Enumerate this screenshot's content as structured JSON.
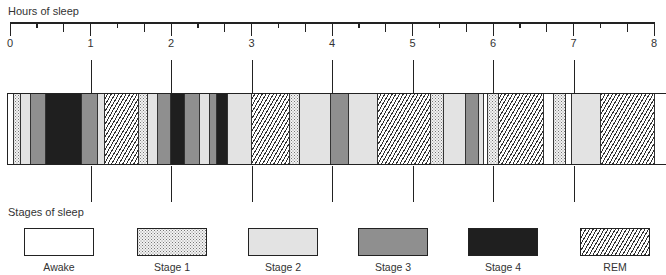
{
  "axis": {
    "title": "Hours of sleep",
    "min": 0,
    "max": 8,
    "tick_labels": [
      "0",
      "1",
      "2",
      "3",
      "4",
      "5",
      "6",
      "7",
      "8"
    ],
    "minor_ticks_per_hour": 3
  },
  "legend": {
    "title": "Stages of sleep",
    "items": [
      {
        "key": "awake",
        "label": "Awake"
      },
      {
        "key": "stage1",
        "label": "Stage 1"
      },
      {
        "key": "stage2",
        "label": "Stage 2"
      },
      {
        "key": "stage3",
        "label": "Stage 3"
      },
      {
        "key": "stage4",
        "label": "Stage 4"
      },
      {
        "key": "rem",
        "label": "REM"
      }
    ]
  },
  "chart_data": {
    "type": "timeline",
    "title": "Hours of sleep",
    "xlabel": "Hours of sleep",
    "xlim": [
      0,
      8
    ],
    "legend_title": "Stages of sleep",
    "categories": [
      "Awake",
      "Stage 1",
      "Stage 2",
      "Stage 3",
      "Stage 4",
      "REM"
    ],
    "segments": [
      {
        "stage": "awake",
        "start": -0.04,
        "end": 0.04
      },
      {
        "stage": "stage1",
        "start": 0.04,
        "end": 0.12
      },
      {
        "stage": "stage2",
        "start": 0.12,
        "end": 0.25
      },
      {
        "stage": "stage3",
        "start": 0.25,
        "end": 0.43
      },
      {
        "stage": "stage4",
        "start": 0.43,
        "end": 0.88
      },
      {
        "stage": "stage3",
        "start": 0.88,
        "end": 1.08
      },
      {
        "stage": "stage2",
        "start": 1.08,
        "end": 1.17
      },
      {
        "stage": "rem",
        "start": 1.17,
        "end": 1.59
      },
      {
        "stage": "stage1",
        "start": 1.59,
        "end": 1.7
      },
      {
        "stage": "stage2",
        "start": 1.7,
        "end": 1.83
      },
      {
        "stage": "stage3",
        "start": 1.83,
        "end": 1.99
      },
      {
        "stage": "stage4",
        "start": 1.99,
        "end": 2.16
      },
      {
        "stage": "stage3",
        "start": 2.16,
        "end": 2.35
      },
      {
        "stage": "stage2",
        "start": 2.35,
        "end": 2.47
      },
      {
        "stage": "stage3",
        "start": 2.47,
        "end": 2.56
      },
      {
        "stage": "stage4",
        "start": 2.56,
        "end": 2.7
      },
      {
        "stage": "stage2",
        "start": 2.7,
        "end": 2.99
      },
      {
        "stage": "rem",
        "start": 2.99,
        "end": 3.47
      },
      {
        "stage": "stage1",
        "start": 3.47,
        "end": 3.59
      },
      {
        "stage": "stage2",
        "start": 3.59,
        "end": 3.98
      },
      {
        "stage": "stage3",
        "start": 3.98,
        "end": 4.2
      },
      {
        "stage": "stage2",
        "start": 4.2,
        "end": 4.56
      },
      {
        "stage": "rem",
        "start": 4.56,
        "end": 5.22
      },
      {
        "stage": "stage1",
        "start": 5.22,
        "end": 5.38
      },
      {
        "stage": "stage2",
        "start": 5.38,
        "end": 5.65
      },
      {
        "stage": "stage3",
        "start": 5.65,
        "end": 5.81
      },
      {
        "stage": "stage2",
        "start": 5.81,
        "end": 5.88
      },
      {
        "stage": "awake",
        "start": 5.88,
        "end": 5.93
      },
      {
        "stage": "stage1",
        "start": 5.93,
        "end": 6.06
      },
      {
        "stage": "rem",
        "start": 6.06,
        "end": 6.62
      },
      {
        "stage": "awake",
        "start": 6.62,
        "end": 6.75
      },
      {
        "stage": "stage1",
        "start": 6.75,
        "end": 6.89
      },
      {
        "stage": "awake",
        "start": 6.89,
        "end": 6.97
      },
      {
        "stage": "stage2",
        "start": 6.97,
        "end": 7.33
      },
      {
        "stage": "rem",
        "start": 7.33,
        "end": 8.0
      },
      {
        "stage": "awake",
        "start": 8.0,
        "end": 8.15
      }
    ]
  }
}
